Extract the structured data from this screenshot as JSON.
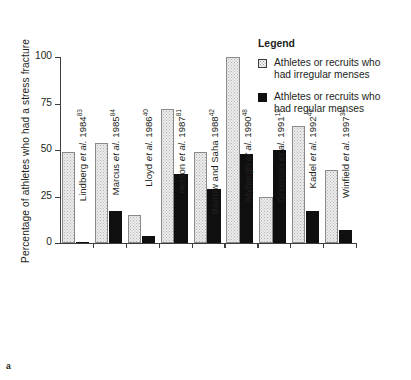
{
  "panel_label": "a",
  "chart_data": {
    "type": "bar",
    "title": "",
    "xlabel": "",
    "ylabel": "Percentage of athletes who had a stress fracture",
    "ylim": [
      0,
      100
    ],
    "yticks": [
      0,
      25,
      50,
      75,
      100
    ],
    "ytick_labels": [
      "0",
      "25",
      "50",
      "75",
      "100"
    ],
    "grid": false,
    "legend_position": "upper-right",
    "categories": [
      "Lindberg et al. 1984",
      "Marcus et al. 1985",
      "Lloyd et al. 1986",
      "Nelson et al. 1987",
      "Barrow and Saha 1988",
      "Myburgh et al. 1990",
      "Grimston et al. 1991",
      "Kadel et al. 1992",
      "Winfield et al. 1997"
    ],
    "category_parts": [
      {
        "author": "Lindberg ",
        "etal": "et al.",
        "year": " 1984",
        "ref": "83"
      },
      {
        "author": "Marcus ",
        "etal": "et al.",
        "year": " 1985",
        "ref": "84"
      },
      {
        "author": "Lloyd ",
        "etal": "et al.",
        "year": " 1986",
        "ref": "40"
      },
      {
        "author": "Nelson ",
        "etal": "et al.",
        "year": " 1987",
        "ref": "81"
      },
      {
        "author": "Barrow and Saha",
        "etal": "",
        "year": " 1988",
        "ref": "42"
      },
      {
        "author": "Myburgh ",
        "etal": "et al.",
        "year": " 1990",
        "ref": "48"
      },
      {
        "author": "Grimston ",
        "etal": "et al.",
        "year": " 1991",
        "ref": "19"
      },
      {
        "author": "Kadel ",
        "etal": "et al.",
        "year": " 1992",
        "ref": "43"
      },
      {
        "author": "Winfield ",
        "etal": "et al.",
        "year": " 1997",
        "ref": "38"
      }
    ],
    "series": [
      {
        "name": "Athletes or recruits who had irregular menses",
        "color": "#ececec",
        "pattern": "dotted",
        "values": [
          49,
          54,
          15,
          72,
          49,
          100,
          25,
          63,
          39
        ]
      },
      {
        "name": "Athletes or recruits who had regular menses",
        "color": "#100f0f",
        "pattern": "solid",
        "values": [
          0,
          17,
          4,
          37,
          29,
          48,
          50,
          17,
          7
        ]
      }
    ]
  },
  "legend": {
    "title": "Legend",
    "entries": [
      {
        "swatch": "irregular",
        "line1": "Athletes or recruits who",
        "line2": "had irregular menses"
      },
      {
        "swatch": "regular",
        "line1": "Athletes or recruits who",
        "line2": "had regular menses"
      }
    ]
  }
}
